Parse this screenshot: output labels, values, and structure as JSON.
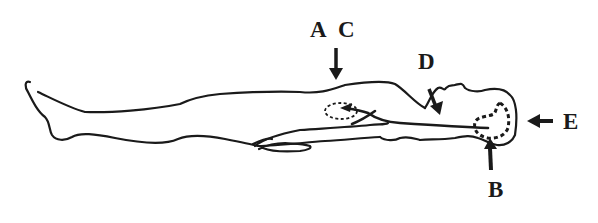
{
  "diagram": {
    "colors": {
      "ink": "#1a1a1a",
      "background": "#ffffff"
    },
    "labels": {
      "a": "A",
      "c": "C",
      "d": "D",
      "e": "E",
      "b": "B"
    },
    "arrows": [
      {
        "label": "A C",
        "direction": "down",
        "target": "upper torso / chest"
      },
      {
        "label": "D",
        "direction": "down-right",
        "target": "neck"
      },
      {
        "label": "E",
        "direction": "left",
        "target": "top of head"
      },
      {
        "label": "B",
        "direction": "up",
        "target": "back of head"
      }
    ],
    "regions": [
      {
        "name": "dashed-region-chest",
        "style": "dashed"
      },
      {
        "name": "dashed-region-head",
        "style": "dashed"
      }
    ]
  }
}
